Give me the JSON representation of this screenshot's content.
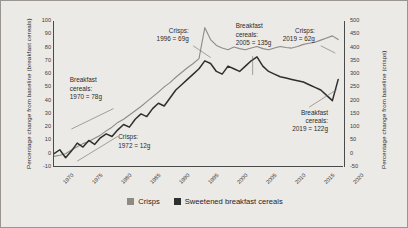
{
  "chart_data": {
    "type": "line",
    "title": "",
    "xlabel": "",
    "ylabel_left": "Percentage change from baseline (breakfast cereals)",
    "ylabel_right": "Percentage change from baseline (crisps)",
    "grid": false,
    "legend_position": "bottom",
    "xlim": [
      1970,
      2020
    ],
    "xticks": [
      1970,
      1975,
      1980,
      1985,
      1990,
      1995,
      2000,
      2005,
      2010,
      2015,
      2020
    ],
    "ylim_left": [
      -10,
      100
    ],
    "yticks_left": [
      -10,
      0,
      10,
      20,
      30,
      40,
      50,
      60,
      70,
      80,
      90,
      100
    ],
    "ylim_right": [
      -50,
      500
    ],
    "yticks_right": [
      -50,
      0,
      50,
      100,
      150,
      200,
      250,
      300,
      350,
      400,
      450,
      500
    ],
    "colors": {
      "crisps": "#8e8b85",
      "cereals": "#2f2f2f"
    },
    "series": [
      {
        "name": "Crisps",
        "axis": "right",
        "color": "#8e8b85",
        "x": [
          1970,
          1971,
          1972,
          1973,
          1974,
          1975,
          1976,
          1977,
          1978,
          1979,
          1980,
          1981,
          1982,
          1983,
          1984,
          1985,
          1986,
          1987,
          1988,
          1989,
          1990,
          1991,
          1992,
          1993,
          1994,
          1995,
          1996,
          1997,
          1998,
          1999,
          2000,
          2001,
          2002,
          2003,
          2004,
          2005,
          2006,
          2007,
          2008,
          2009,
          2010,
          2011,
          2012,
          2013,
          2014,
          2015,
          2016,
          2017,
          2018,
          2019
        ],
        "values": [
          -10,
          -6,
          0,
          14,
          26,
          38,
          46,
          58,
          70,
          86,
          100,
          118,
          130,
          146,
          162,
          178,
          196,
          214,
          232,
          252,
          268,
          288,
          306,
          324,
          340,
          358,
          475,
          430,
          408,
          398,
          392,
          402,
          396,
          392,
          398,
          404,
          396,
          392,
          398,
          404,
          400,
          398,
          404,
          412,
          416,
          420,
          428,
          436,
          444,
          430
        ]
      },
      {
        "name": "Sweetened breakfast cereals",
        "axis": "left",
        "color": "#2f2f2f",
        "x": [
          1970,
          1971,
          1972,
          1973,
          1974,
          1975,
          1976,
          1977,
          1978,
          1979,
          1980,
          1981,
          1982,
          1983,
          1984,
          1985,
          1986,
          1987,
          1988,
          1989,
          1990,
          1991,
          1992,
          1993,
          1994,
          1995,
          1996,
          1997,
          1998,
          1999,
          2000,
          2001,
          2002,
          2003,
          2004,
          2005,
          2006,
          2007,
          2008,
          2009,
          2010,
          2011,
          2012,
          2013,
          2014,
          2015,
          2016,
          2017,
          2018,
          2019
        ],
        "values": [
          0,
          3,
          -3,
          2,
          8,
          5,
          10,
          7,
          12,
          15,
          13,
          18,
          22,
          20,
          26,
          30,
          28,
          34,
          38,
          36,
          42,
          48,
          52,
          56,
          60,
          64,
          70,
          68,
          62,
          60,
          66,
          64,
          62,
          66,
          70,
          73,
          66,
          62,
          60,
          58,
          57,
          56,
          55,
          54,
          52,
          50,
          48,
          44,
          40,
          56
        ]
      }
    ],
    "annotations": [
      {
        "id": "cereals-1970",
        "lines": [
          "Breakfast",
          "cereals:",
          "1970 = 78g"
        ],
        "align": "left",
        "x_pct": 5.8,
        "y_pct": 38.0,
        "leader": {
          "x1": 20.5,
          "y1": 60.0,
          "x2": 6.0,
          "y2": 74.0
        }
      },
      {
        "id": "crisps-1972",
        "lines": [
          "Crisps:",
          "1972 = 12g"
        ],
        "align": "left",
        "x_pct": 22.5,
        "y_pct": 77.0,
        "leader": {
          "x1": 22.0,
          "y1": 79.0,
          "x2": 8.0,
          "y2": 96.0
        }
      },
      {
        "id": "crisps-1996",
        "lines": [
          "Crisps:",
          "1996 = 69g"
        ],
        "align": "right",
        "x_pct": 47.5,
        "y_pct": 4.0,
        "leader": {
          "x1": 48.0,
          "y1": 17.0,
          "x2": 54.0,
          "y2": 25.0
        }
      },
      {
        "id": "cereals-2005",
        "lines": [
          "Breakfast",
          "cereals:",
          "2005 = 135g"
        ],
        "align": "left",
        "x_pct": 63.0,
        "y_pct": 1.0,
        "leader": {
          "x1": 68.5,
          "y1": 24.0,
          "x2": 68.5,
          "y2": 37.0
        }
      },
      {
        "id": "crisps-2019",
        "lines": [
          "Crisps:",
          "2019 = 62g"
        ],
        "align": "right",
        "x_pct": 91.0,
        "y_pct": 4.0,
        "leader": {
          "x1": 92.0,
          "y1": 17.0,
          "x2": 97.0,
          "y2": 22.0
        }
      },
      {
        "id": "cereals-2019",
        "lines": [
          "Breakfast",
          "cereals:",
          "2019 = 122g"
        ],
        "align": "right",
        "x_pct": 95.5,
        "y_pct": 60.0,
        "leader": {
          "x1": 88.0,
          "y1": 59.0,
          "x2": 97.5,
          "y2": 47.0
        }
      }
    ]
  },
  "axes": {
    "left_title": "Percentage change from baseline (breakfast cereals)",
    "right_title": "Percentage change from baseline (crisps)",
    "left_ticks": [
      "100",
      "90",
      "80",
      "70",
      "60",
      "50",
      "40",
      "30",
      "20",
      "10",
      "0",
      "-10"
    ],
    "right_ticks": [
      "500",
      "450",
      "400",
      "350",
      "300",
      "250",
      "200",
      "150",
      "100",
      "50",
      "0",
      "-50"
    ],
    "x_ticks": [
      "1970",
      "1975",
      "1980",
      "1985",
      "1990",
      "1995",
      "2000",
      "2005",
      "2010",
      "2015",
      "2020"
    ]
  },
  "annotations": {
    "cereals_1970": {
      "l1": "Breakfast",
      "l2": "cereals:",
      "l3": "1970 = 78g"
    },
    "crisps_1972": {
      "l1": "Crisps:",
      "l2": "1972 = 12g"
    },
    "crisps_1996": {
      "l1": "Crisps:",
      "l2": "1996 = 69g"
    },
    "cereals_2005": {
      "l1": "Breakfast",
      "l2": "cereals:",
      "l3": "2005 = 135g"
    },
    "crisps_2019": {
      "l1": "Crisps:",
      "l2": "2019 = 62g"
    },
    "cereals_2019": {
      "l1": "Breakfast",
      "l2": "cereals:",
      "l3": "2019 = 122g"
    }
  },
  "legend": {
    "items": [
      {
        "label": "Crisps",
        "color": "#8e8b85"
      },
      {
        "label": "Sweetened breakfast cereals",
        "color": "#2f2f2f"
      }
    ]
  }
}
